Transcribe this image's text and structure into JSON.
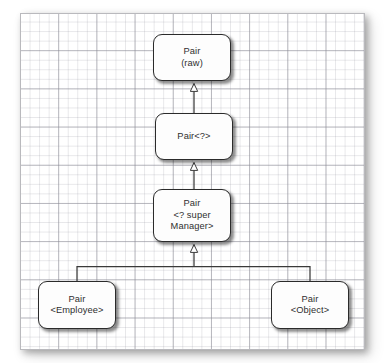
{
  "diagram": {
    "type": "uml-class-hierarchy",
    "canvas": {
      "background": "grid-paper",
      "grid_minor_color": "#e3e3e8",
      "grid_major_color": "#9aa0a6",
      "border_color": "#b9b9bd",
      "fill_color": "#ffffff"
    },
    "style": {
      "node_fill": "#fdfdfd",
      "node_border": "#2b2b2b",
      "text_color": "#2f2f2f",
      "connector_color": "#3a3a3a",
      "arrowhead": "hollow-triangle"
    },
    "nodes": [
      {
        "id": "pair-raw",
        "label": "Pair\n(raw)"
      },
      {
        "id": "pair-wildcard",
        "label": "Pair<?>"
      },
      {
        "id": "pair-super",
        "label": "Pair\n<? super\nManager>"
      },
      {
        "id": "pair-employee",
        "label": "Pair\n<Employee>"
      },
      {
        "id": "pair-object",
        "label": "Pair\n<Object>"
      }
    ],
    "edges": [
      {
        "id": "edge-wildcard-to-raw",
        "from": "pair-wildcard",
        "to": "pair-raw",
        "relation": "generalization"
      },
      {
        "id": "edge-super-to-wildcard",
        "from": "pair-super",
        "to": "pair-wildcard",
        "relation": "generalization"
      },
      {
        "id": "edge-employee-to-super",
        "from": "pair-employee",
        "to": "pair-super",
        "relation": "generalization"
      },
      {
        "id": "edge-object-to-super",
        "from": "pair-object",
        "to": "pair-super",
        "relation": "generalization"
      }
    ]
  }
}
